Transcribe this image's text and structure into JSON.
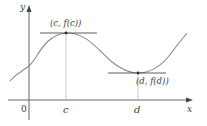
{
  "diagram": {
    "type": "function-graph",
    "axes": {
      "x_label": "x",
      "y_label": "y",
      "origin_label": "0"
    },
    "tick_labels": {
      "c": "c",
      "d": "d"
    },
    "points": {
      "max": {
        "label": "(c, f(c))",
        "x_tick": "c"
      },
      "min": {
        "label": "(d, f(d))",
        "x_tick": "d"
      }
    },
    "colors": {
      "axis": "#555555",
      "curve": "#8a8a8a",
      "tangent": "#4a4a4a",
      "guide": "#b0b0b0",
      "text": "#3a3a3a"
    }
  }
}
